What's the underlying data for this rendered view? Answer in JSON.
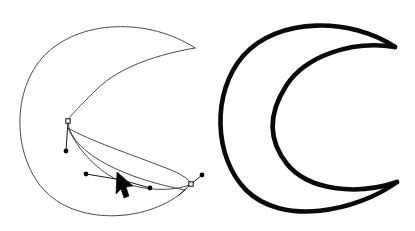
{
  "scene": {
    "title": "Crescent moon bezier path editing",
    "background_color": "#ffffff",
    "width": 415,
    "height": 231
  },
  "left_figure": {
    "name": "crescent-editing-state",
    "label": "Crescent path in edit mode",
    "stroke_color": "#4a4a4a",
    "stroke_width": 1,
    "fill": "none",
    "outer_arc_path": "M 195 48 C 150 18 78 18 42 58 C 10 95 14 160 46 192 C 80 226 150 222 185 190",
    "inner_arc_path": "M 195 48 C 160 54 120 66 96 90 C 76 110 68 118 68 121 C 68 135 82 152 110 166 C 142 182 176 188 185 190",
    "secondary_curve_path": "M 68 128 C 88 140 130 154 166 168 C 182 174 190 180 191 184",
    "lower_curve_path": "M 68 128 C 78 150 98 172 122 182 C 150 193 180 190 191 184"
  },
  "right_figure": {
    "name": "crescent-final-state",
    "label": "Finished crescent moon",
    "stroke_color": "#0a0a0a",
    "stroke_width": 4.6,
    "fill": "none",
    "outer_arc_path": "M 395 47 C 352 18 278 16 243 56 C 211 93 214 158 246 190 C 282 226 356 212 397 182",
    "inner_arc_path": "M 395 47 C 352 40 305 56 286 86 C 268 114 268 140 287 164 C 308 190 356 196 397 182"
  },
  "editor_nodes": {
    "anchors": [
      {
        "name": "anchor-upper",
        "x": 68,
        "y": 121,
        "type": "square",
        "state": "selected"
      },
      {
        "name": "anchor-lower-right",
        "x": 191,
        "y": 184,
        "type": "square",
        "state": "selected"
      }
    ],
    "control_handles": [
      {
        "name": "handle-upper-down",
        "from_x": 68,
        "from_y": 121,
        "to_x": 66,
        "to_y": 151
      },
      {
        "name": "handle-lower-left",
        "from_x": 122,
        "from_y": 180,
        "to_x": 86,
        "to_y": 174
      },
      {
        "name": "handle-lower-right",
        "from_x": 122,
        "from_y": 180,
        "to_x": 150,
        "to_y": 188
      },
      {
        "name": "handle-anchor-right-out",
        "from_x": 191,
        "from_y": 184,
        "to_x": 202,
        "to_y": 175
      },
      {
        "name": "handle-anchor-right-in",
        "from_x": 191,
        "from_y": 184,
        "to_x": 178,
        "to_y": 196
      }
    ],
    "handle_dots": [
      {
        "name": "handle-dot-upper",
        "x": 66,
        "y": 151,
        "r": 2.4
      },
      {
        "name": "handle-dot-left",
        "x": 86,
        "y": 174,
        "r": 2.4
      },
      {
        "name": "handle-dot-right-lower",
        "x": 150,
        "y": 188,
        "r": 2.4
      },
      {
        "name": "handle-dot-far-right",
        "x": 202,
        "y": 175,
        "r": 2.4
      }
    ]
  },
  "pointer": {
    "name": "mouse-cursor",
    "label": "Arrow pointer",
    "x": 117,
    "y": 172,
    "color": "#000000",
    "shape_path": "M 117 172 L 133 186 L 126 187 L 129 196 L 124 198 L 121 189 L 116 194 Z"
  }
}
